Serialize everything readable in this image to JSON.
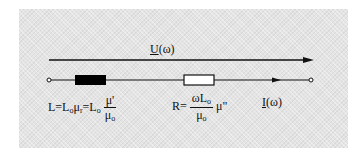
{
  "diagram": {
    "voltage_label": {
      "symbol": "U",
      "arg": "(ω)"
    },
    "current_label": {
      "symbol": "I",
      "arg": "(ω)"
    },
    "inductor": {
      "fill": "#000000",
      "formula": {
        "lhs": "L=L",
        "lhs_sub": "o",
        "mu": "μ",
        "mu_sub": "r",
        "eq": "=L",
        "eq_sub": "o",
        "num": "μ'",
        "den": "μ",
        "den_sub": "o"
      }
    },
    "resistor": {
      "fill": "#ffffff",
      "formula": {
        "lhs": "R=",
        "num": "ωL",
        "num_sub": "o",
        "den": "μ",
        "den_sub": "o",
        "tail": "μ\""
      }
    },
    "colors": {
      "panel": "#e4e4e4",
      "line": "#111111"
    }
  }
}
